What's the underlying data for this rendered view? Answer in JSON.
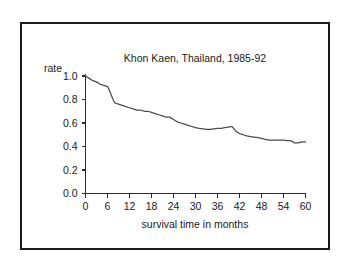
{
  "chart_data": {
    "type": "line",
    "title": "Khon Kaen, Thailand, 1985-92",
    "xlabel": "survival time in months",
    "ylabel": "rate",
    "xlim": [
      0,
      60
    ],
    "ylim": [
      0.0,
      1.0
    ],
    "grid": false,
    "legend": null,
    "xticks": [
      "0",
      "6",
      "12",
      "18",
      "24",
      "30",
      "36",
      "42",
      "48",
      "54",
      "60"
    ],
    "xtick_values": [
      0,
      6,
      12,
      18,
      24,
      30,
      36,
      42,
      48,
      54,
      60
    ],
    "yticks": [
      "0.0",
      "0.2",
      "0.4",
      "0.6",
      "0.8",
      "1.0"
    ],
    "ytick_values": [
      0.0,
      0.2,
      0.4,
      0.6,
      0.8,
      1.0
    ],
    "series": [
      {
        "name": "survival rate",
        "color": "#4a4a4a",
        "x": [
          0,
          1,
          2,
          3,
          4,
          5,
          6,
          6.5,
          7,
          7.5,
          8,
          9,
          10,
          11,
          12,
          13,
          14,
          15,
          16,
          17,
          18,
          19,
          20,
          21,
          22,
          23,
          24,
          25,
          26,
          27,
          28,
          29,
          30,
          31,
          32,
          33,
          34,
          35,
          36,
          37,
          38,
          39,
          39.5,
          40,
          40.5,
          41,
          42,
          43,
          44,
          45,
          46,
          47,
          48,
          49,
          50,
          51,
          52,
          53,
          54,
          55,
          56,
          57,
          58,
          59,
          60
        ],
        "y": [
          1.0,
          0.98,
          0.96,
          0.95,
          0.93,
          0.92,
          0.91,
          0.88,
          0.84,
          0.8,
          0.77,
          0.76,
          0.75,
          0.74,
          0.73,
          0.72,
          0.71,
          0.71,
          0.7,
          0.7,
          0.69,
          0.68,
          0.67,
          0.66,
          0.65,
          0.65,
          0.63,
          0.61,
          0.6,
          0.59,
          0.58,
          0.57,
          0.56,
          0.555,
          0.55,
          0.545,
          0.545,
          0.55,
          0.555,
          0.555,
          0.56,
          0.565,
          0.57,
          0.57,
          0.55,
          0.53,
          0.51,
          0.5,
          0.49,
          0.485,
          0.48,
          0.475,
          0.47,
          0.46,
          0.455,
          0.455,
          0.455,
          0.455,
          0.455,
          0.45,
          0.45,
          0.43,
          0.43,
          0.44,
          0.44
        ]
      }
    ]
  },
  "axes": {
    "rate_label": "rate"
  }
}
